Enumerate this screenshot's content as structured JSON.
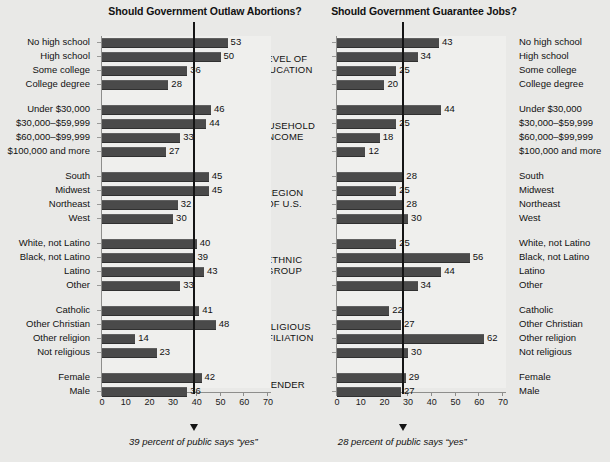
{
  "figure": {
    "background_color": "#e9e9e7",
    "bar_color": "#4a4a4a",
    "mean_line_color": "#151515"
  },
  "charts": {
    "left": {
      "title": "Should Government Outlaw Abortions?",
      "footnote": "39 percent of public says “yes”",
      "mean_value": 39,
      "xlim": [
        0,
        75
      ],
      "ticks": [
        0,
        10,
        20,
        30,
        40,
        50,
        60,
        70
      ]
    },
    "right": {
      "title": "Should Government Guarantee Jobs?",
      "footnote": "28 percent of public says “yes”",
      "mean_value": 28,
      "xlim": [
        0,
        75
      ],
      "ticks": [
        0,
        10,
        20,
        30,
        40,
        50,
        60,
        70
      ]
    }
  },
  "groups": [
    {
      "name": "LEVEL OF\nEDUCATION",
      "categories": [
        "No high school",
        "High school",
        "Some college",
        "College degree"
      ]
    },
    {
      "name": "HOUSEHOLD\nINCOME",
      "categories": [
        "Under $30,000",
        "$30,000–$59,999",
        "$60,000–$99,999",
        "$100,000 and more"
      ]
    },
    {
      "name": "REGION\nOF U.S.",
      "categories": [
        "South",
        "Midwest",
        "Northeast",
        "West"
      ]
    },
    {
      "name": "ETHNIC\nGROUP",
      "categories": [
        "White, not Latino",
        "Black, not Latino",
        "Latino",
        "Other"
      ]
    },
    {
      "name": "RELIGIOUS\nAFFILIATION",
      "categories": [
        "Catholic",
        "Other Christian",
        "Other religion",
        "Not religious"
      ]
    },
    {
      "name": "GENDER",
      "categories": [
        "Female",
        "Male"
      ]
    }
  ],
  "chart_data": [
    {
      "type": "bar",
      "orientation": "horizontal",
      "title": "Should Government Outlaw Abortions?",
      "xlabel": "",
      "ylabel": "",
      "xlim": [
        0,
        75
      ],
      "ticks": [
        0,
        10,
        20,
        30,
        40,
        50,
        60,
        70
      ],
      "grid": false,
      "legend": "none",
      "annotation": "39 percent of public says “yes”",
      "reference_line": 39,
      "categories": [
        "No high school",
        "High school",
        "Some college",
        "College degree",
        "Under $30,000",
        "$30,000–$59,999",
        "$60,000–$99,999",
        "$100,000 and more",
        "South",
        "Midwest",
        "Northeast",
        "West",
        "White, not Latino",
        "Black, not Latino",
        "Latino",
        "Other",
        "Catholic",
        "Other Christian",
        "Other religion",
        "Not religious",
        "Female",
        "Male"
      ],
      "values": [
        53,
        50,
        36,
        28,
        46,
        44,
        33,
        27,
        45,
        45,
        32,
        30,
        40,
        39,
        43,
        33,
        41,
        48,
        14,
        23,
        42,
        36
      ]
    },
    {
      "type": "bar",
      "orientation": "horizontal",
      "title": "Should Government Guarantee Jobs?",
      "xlabel": "",
      "ylabel": "",
      "xlim": [
        0,
        75
      ],
      "ticks": [
        0,
        10,
        20,
        30,
        40,
        50,
        60,
        70
      ],
      "grid": false,
      "legend": "none",
      "annotation": "28 percent of public says “yes”",
      "reference_line": 28,
      "categories": [
        "No high school",
        "High school",
        "Some college",
        "College degree",
        "Under $30,000",
        "$30,000–$59,999",
        "$60,000–$99,999",
        "$100,000 and more",
        "South",
        "Midwest",
        "Northeast",
        "West",
        "White, not Latino",
        "Black, not Latino",
        "Latino",
        "Other",
        "Catholic",
        "Other Christian",
        "Other religion",
        "Not religious",
        "Female",
        "Male"
      ],
      "values": [
        43,
        34,
        25,
        20,
        44,
        25,
        18,
        12,
        28,
        25,
        28,
        30,
        25,
        56,
        44,
        34,
        22,
        27,
        62,
        30,
        29,
        27
      ]
    }
  ]
}
